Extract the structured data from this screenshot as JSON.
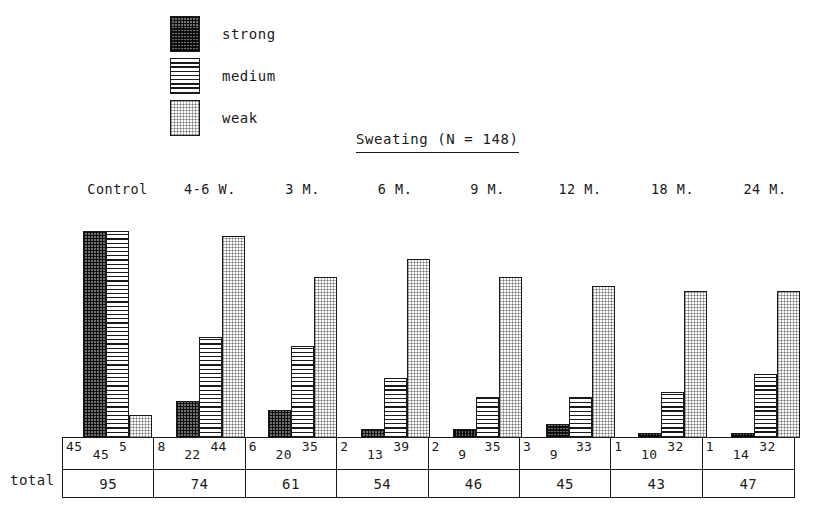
{
  "chart_data": {
    "type": "bar",
    "title": "Sweating  (N = 148)",
    "xlabel": "",
    "ylabel": "",
    "grid": false,
    "legend_position": "top-left",
    "categories": [
      "Control",
      "4-6 W.",
      "3 M.",
      "6 M.",
      "9 M.",
      "12 M.",
      "18 M.",
      "24 M."
    ],
    "series": [
      {
        "name": "strong",
        "values": [
          45,
          8,
          6,
          2,
          2,
          3,
          1,
          1
        ]
      },
      {
        "name": "medium",
        "values": [
          45,
          22,
          20,
          13,
          9,
          9,
          10,
          14
        ]
      },
      {
        "name": "weak",
        "values": [
          5,
          44,
          35,
          39,
          35,
          33,
          32,
          32
        ]
      }
    ],
    "totals": [
      95,
      74,
      61,
      54,
      46,
      45,
      43,
      47
    ],
    "ylim": [
      0,
      45
    ],
    "value_scale_px_per_unit": 4.6
  },
  "legend": {
    "items": [
      {
        "label": "strong",
        "pattern": "dark-checker",
        "color": "#5a5a5a"
      },
      {
        "label": "medium",
        "pattern": "horizontal-lines",
        "color": "#ffffff"
      },
      {
        "label": "weak",
        "pattern": "light-dots",
        "color": "#fbfbfb"
      }
    ]
  },
  "table": {
    "total_row_label": "total"
  }
}
